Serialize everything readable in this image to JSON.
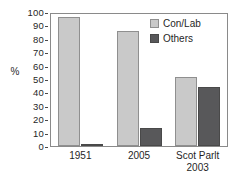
{
  "chart_data": {
    "type": "bar",
    "title": "",
    "xlabel": "",
    "ylabel": "%",
    "ylim": [
      0,
      100
    ],
    "ytick_labels": [
      "100",
      "90",
      "80",
      "70",
      "60",
      "50",
      "40",
      "30",
      "20",
      "10",
      "0"
    ],
    "ytick_values": [
      100,
      90,
      80,
      70,
      60,
      50,
      40,
      30,
      20,
      10,
      0
    ],
    "grid": false,
    "legend_position": "top-right",
    "categories": [
      "1951",
      "2005",
      "Scot Parlt 2003"
    ],
    "category_labels": [
      {
        "line1": "1951",
        "line2": ""
      },
      {
        "line1": "2005",
        "line2": ""
      },
      {
        "line1": "Scot Parlt",
        "line2": "2003"
      }
    ],
    "series": [
      {
        "name": "Con/Lab",
        "color": "#c9c9c9",
        "values": [
          98,
          87,
          52
        ]
      },
      {
        "name": "Others",
        "color": "#58585a",
        "values": [
          1,
          14,
          45
        ]
      }
    ]
  },
  "legend": {
    "items": [
      {
        "label": "Con/Lab",
        "swatch": "conlab"
      },
      {
        "label": "Others",
        "swatch": "others"
      }
    ]
  },
  "colors": {
    "conlab": "#c9c9c9",
    "others": "#58585a",
    "frame": "#8a8a8a",
    "text": "#1f1f1f",
    "background": "#ffffff"
  }
}
